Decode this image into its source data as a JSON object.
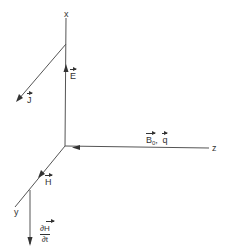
{
  "diagram": {
    "axes": {
      "x": {
        "label": "x"
      },
      "y": {
        "label": "y"
      },
      "z": {
        "label": "z"
      }
    },
    "vectors": {
      "E": {
        "symbol": "E",
        "direction": "+x"
      },
      "J": {
        "symbol": "J",
        "direction": "+y"
      },
      "B0": {
        "symbol": "B",
        "subscript": "0",
        "direction": "-z"
      },
      "q": {
        "symbol": "q",
        "direction": "-z"
      },
      "B0q_separator": ",",
      "H": {
        "symbol": "H",
        "direction": "+y"
      },
      "dHdt": {
        "numerator": "∂H",
        "denominator": "∂t",
        "direction": "-x"
      }
    },
    "colors": {
      "line": "#555555",
      "text": "#333333",
      "background": "#ffffff"
    }
  }
}
